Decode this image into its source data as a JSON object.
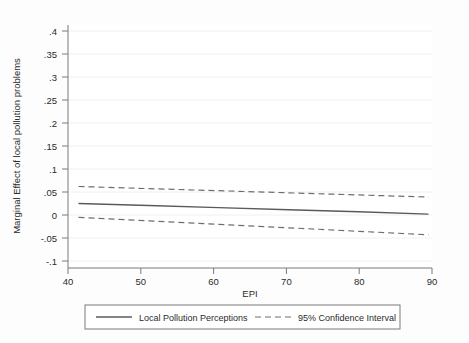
{
  "chart_data": {
    "type": "line",
    "title": "",
    "xlabel": "EPI",
    "ylabel": "Marginal Effect of local pollution problems",
    "xlim": [
      38.5,
      90.5
    ],
    "ylim": [
      -0.1,
      0.42
    ],
    "grid": true,
    "legend_position": "bottom-outside",
    "xticks": [
      40,
      50,
      60,
      70,
      80,
      90
    ],
    "xtick_labels": [
      "40",
      "50",
      "60",
      "70",
      "80",
      "90"
    ],
    "yticks": [
      -0.1,
      -0.05,
      0,
      0.05,
      0.1,
      0.15,
      0.2,
      0.25,
      0.3,
      0.35,
      0.4
    ],
    "ytick_labels": [
      "-.1",
      "-.05",
      "0",
      ".05",
      ".1",
      ".15",
      ".2",
      ".25",
      ".3",
      ".35",
      ".4"
    ],
    "x": [
      40,
      50,
      60,
      70,
      80,
      90
    ],
    "series": [
      {
        "name": "Local Pollution Perceptions",
        "style": "solid",
        "color": "#5a5a5a",
        "values": [
          0.025,
          0.0205,
          0.016,
          0.0115,
          0.007,
          0.002
        ]
      },
      {
        "name": "95% Confidence Interval Upper",
        "style": "dashed",
        "color": "#6e6e6e",
        "values": [
          0.062,
          0.0574,
          0.0528,
          0.0482,
          0.0436,
          0.039
        ]
      },
      {
        "name": "95% Confidence Interval Lower",
        "style": "dashed",
        "color": "#6e6e6e",
        "values": [
          -0.005,
          -0.0126,
          -0.0202,
          -0.0278,
          -0.0354,
          -0.043
        ]
      }
    ],
    "legend_entries": [
      {
        "label": "Local Pollution Perceptions",
        "style": "solid"
      },
      {
        "label": "95% Confidence Interval",
        "style": "dashed"
      }
    ]
  },
  "axes": {
    "x_title": "EPI",
    "y_title": "Marginal Effect of local pollution problems",
    "xtick_0": "40",
    "xtick_1": "50",
    "xtick_2": "60",
    "xtick_3": "70",
    "xtick_4": "80",
    "xtick_5": "90",
    "ytick_0": ".4",
    "ytick_1": ".35",
    "ytick_2": ".3",
    "ytick_3": ".25",
    "ytick_4": ".2",
    "ytick_5": ".15",
    "ytick_6": ".1",
    "ytick_7": ".05",
    "ytick_8": "0",
    "ytick_9": "-.05",
    "ytick_10": "-.1"
  },
  "legend": {
    "entry_solid_label": "Local Pollution Perceptions",
    "entry_dashed_label": "95% Confidence Interval"
  }
}
